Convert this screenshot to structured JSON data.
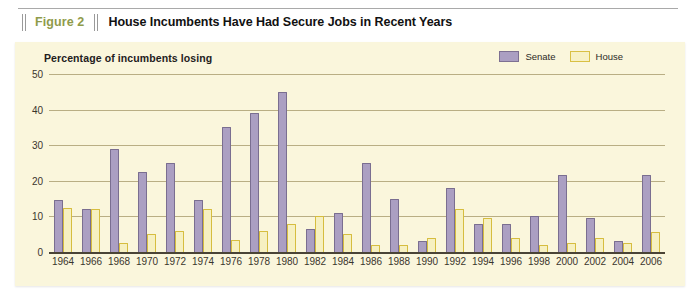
{
  "figure": {
    "number_label": "Figure 2",
    "title": "House Incumbents Have Had Secure Jobs in Recent Years"
  },
  "legend": {
    "senate_label": "Senate",
    "house_label": "House",
    "senate_color": "#ab9fc2",
    "house_color": "#f7f1c4"
  },
  "panel": {
    "background_color": "#faf6dc"
  },
  "chart_data": {
    "type": "bar",
    "title": "Percentage of incumbents losing",
    "xlabel": "",
    "ylabel": "Percentage of incumbents losing",
    "ylim": [
      0,
      50
    ],
    "yticks": [
      0,
      10,
      20,
      30,
      40,
      50
    ],
    "ytick_labels": [
      "0",
      "10",
      "20",
      "30",
      "40",
      "50"
    ],
    "grid": true,
    "legend_position": "top-right",
    "categories": [
      "1964",
      "1966",
      "1968",
      "1970",
      "1972",
      "1974",
      "1976",
      "1978",
      "1980",
      "1982",
      "1984",
      "1986",
      "1988",
      "1990",
      "1992",
      "1994",
      "1996",
      "1998",
      "2000",
      "2002",
      "2004",
      "2006"
    ],
    "tick_labels": [
      "1964",
      "1966",
      "1968",
      "1970",
      "1972",
      "1974",
      "1976",
      "1978",
      "1980",
      "1982",
      "1984",
      "1986",
      "1988",
      "1990",
      "1992",
      "1994",
      "1996",
      "1998",
      "2000",
      "2002",
      "2004",
      "2006"
    ],
    "series": [
      {
        "name": "Senate",
        "color": "#ab9fc2",
        "values": [
          14.5,
          12,
          29,
          22.5,
          25,
          14.5,
          35,
          39,
          45,
          6.5,
          11,
          25,
          15,
          3,
          18,
          8,
          8,
          10,
          21.5,
          9.5,
          3,
          21.5
        ]
      },
      {
        "name": "House",
        "color": "#f7f1c4",
        "values": [
          12.5,
          12,
          2.5,
          5,
          6,
          12,
          3.5,
          6,
          8,
          10,
          5,
          2,
          2,
          4,
          12,
          9.5,
          4,
          2,
          2.5,
          4,
          2.5,
          5.5
        ]
      }
    ]
  }
}
